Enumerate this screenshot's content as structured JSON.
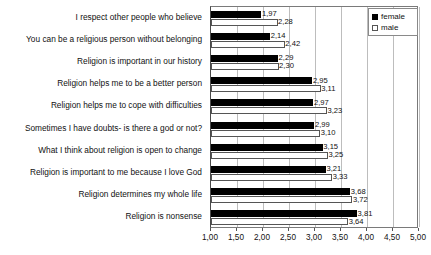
{
  "chart_data": {
    "type": "bar",
    "orientation": "horizontal",
    "title": "",
    "xlabel": "",
    "ylabel": "",
    "xlim": [
      1.0,
      5.0
    ],
    "grid": true,
    "legend_position": "top-right",
    "tick_labels": [
      "1,00",
      "1,50",
      "2,00",
      "2,50",
      "3,00",
      "3,50",
      "4,00",
      "4,50",
      "5,00"
    ],
    "tick_values": [
      1.0,
      1.5,
      2.0,
      2.5,
      3.0,
      3.5,
      4.0,
      4.5,
      5.0
    ],
    "categories": [
      "I respect other people who believe",
      "You can be a religious person without belonging",
      "Religion is important in our history",
      "Religion helps me to be a better person",
      "Religion helps me to cope with difficulties",
      "Sometimes I have doubts- is there a god or not?",
      "What I think about religion is open to change",
      "Religion is important to me because I love God",
      "Religion determines my whole life",
      "Religion is nonsense"
    ],
    "series": [
      {
        "name": "female",
        "color": "#000000",
        "values": [
          1.97,
          2.14,
          2.29,
          2.95,
          2.97,
          2.99,
          3.15,
          3.21,
          3.68,
          3.81
        ],
        "labels": [
          "1,97",
          "2,14",
          "2,29",
          "2,95",
          "2,97",
          "2,99",
          "3,15",
          "3,21",
          "3,68",
          "3,81"
        ]
      },
      {
        "name": "male",
        "color": "#ffffff",
        "values": [
          2.28,
          2.42,
          2.3,
          3.11,
          3.23,
          3.1,
          3.25,
          3.33,
          3.72,
          3.64
        ],
        "labels": [
          "2,28",
          "2,42",
          "2,30",
          "3,11",
          "3,23",
          "3,10",
          "3,25",
          "3,33",
          "3,72",
          "3,64"
        ]
      }
    ]
  },
  "legend": {
    "items": [
      {
        "label": "female",
        "swatch": "filled-square-icon"
      },
      {
        "label": "male",
        "swatch": "open-square-icon"
      }
    ]
  }
}
